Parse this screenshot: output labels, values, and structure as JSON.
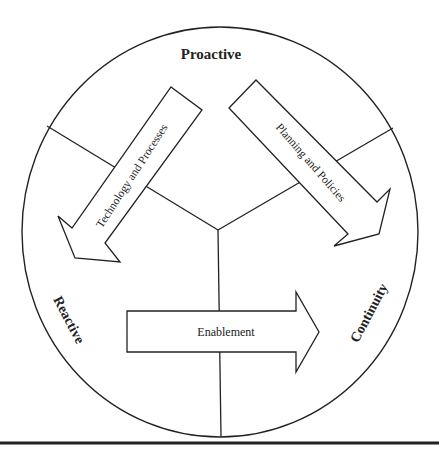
{
  "diagram": {
    "type": "circular-cycle",
    "labels": {
      "top": "Proactive",
      "left": "Reactive",
      "right": "Continuity"
    },
    "arrows": [
      {
        "id": "technology",
        "label": "Technology and Processes",
        "direction": "down-left"
      },
      {
        "id": "planning",
        "label": "Planning and Policies",
        "direction": "down-right"
      },
      {
        "id": "enablement",
        "label": "Enablement",
        "direction": "right"
      }
    ],
    "colors": {
      "stroke": "#222222",
      "fill": "#ffffff",
      "text": "#222222"
    }
  }
}
